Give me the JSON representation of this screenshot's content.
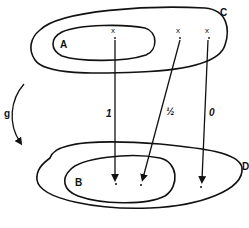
{
  "diagram": {
    "type": "set-mapping",
    "top_sets": {
      "outer": {
        "label": "C"
      },
      "inner": {
        "label": "A"
      }
    },
    "bottom_sets": {
      "outer": {
        "label": "D"
      },
      "inner": {
        "label": "B"
      }
    },
    "map": {
      "label": "g"
    },
    "points": [
      {
        "symbol": "x",
        "location": "A",
        "arrow_label": "1",
        "target": "B"
      },
      {
        "symbol": "x",
        "location": "C minus A",
        "arrow_label": "½",
        "target": "B"
      },
      {
        "symbol": "x",
        "location": "C minus A",
        "arrow_label": "0",
        "target": "D minus B"
      }
    ],
    "colors": {
      "ink": "#111111",
      "background": "#ffffff"
    }
  }
}
